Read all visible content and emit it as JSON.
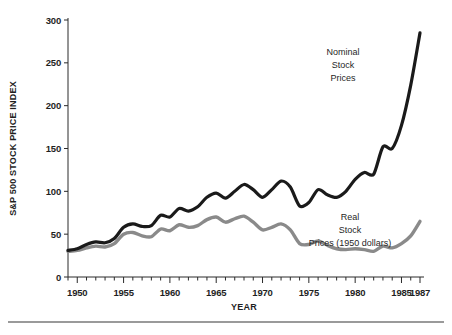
{
  "chart_data": {
    "type": "line",
    "title": "",
    "xlabel": "YEAR",
    "ylabel": "S&P 500 STOCK PRICE INDEX",
    "xlim": [
      1949,
      1987
    ],
    "ylim": [
      0,
      300
    ],
    "ytick_values": [
      0,
      50,
      100,
      150,
      200,
      250,
      300
    ],
    "ytick_labels": [
      "0",
      "50",
      "100",
      "150",
      "200",
      "250",
      "300"
    ],
    "xtick_values": [
      1950,
      1955,
      1960,
      1965,
      1970,
      1975,
      1980,
      1985,
      1987
    ],
    "xtick_labels": [
      "1950",
      "1955",
      "1960",
      "1965",
      "1970",
      "1975",
      "1980",
      "1985",
      "1987"
    ],
    "minor_xticks_every": 1,
    "grid": false,
    "legend_position": "inline-annotations",
    "x": [
      1949,
      1950,
      1951,
      1952,
      1953,
      1954,
      1955,
      1956,
      1957,
      1958,
      1959,
      1960,
      1961,
      1962,
      1963,
      1964,
      1965,
      1966,
      1967,
      1968,
      1969,
      1970,
      1971,
      1972,
      1973,
      1974,
      1975,
      1976,
      1977,
      1978,
      1979,
      1980,
      1981,
      1982,
      1983,
      1984,
      1985,
      1986,
      1987
    ],
    "series": [
      {
        "name": "Nominal Stock Prices",
        "color": "#1a1a1a",
        "linewidth": 3.2,
        "values": [
          31,
          33,
          38,
          41,
          40,
          45,
          58,
          62,
          59,
          60,
          72,
          70,
          80,
          77,
          82,
          93,
          98,
          92,
          100,
          108,
          102,
          93,
          102,
          112,
          105,
          83,
          87,
          102,
          96,
          93,
          100,
          114,
          122,
          120,
          152,
          150,
          177,
          224,
          285
        ]
      },
      {
        "name": "Real Stock Prices (1950 dollars)",
        "color": "#8a8a8a",
        "linewidth": 3.4,
        "values": [
          30,
          31,
          34,
          36,
          35,
          39,
          50,
          52,
          48,
          47,
          56,
          54,
          61,
          58,
          60,
          67,
          70,
          64,
          68,
          71,
          64,
          55,
          58,
          62,
          55,
          39,
          38,
          42,
          37,
          33,
          32,
          33,
          32,
          30,
          36,
          34,
          39,
          48,
          65
        ]
      }
    ],
    "annotations": [
      {
        "id": "nominal-label",
        "lines": [
          "Nominal",
          "Stock",
          "Prices"
        ],
        "x": 343,
        "y": 55
      },
      {
        "id": "real-label",
        "lines": [
          "Real",
          "Stock",
          "Prices (1950 dollars)"
        ],
        "x": 350,
        "y": 220
      }
    ]
  },
  "figure": {
    "background_color": "#ffffff",
    "axis_color": "#2a2a2a",
    "rule_color": "#9a9a9a"
  }
}
